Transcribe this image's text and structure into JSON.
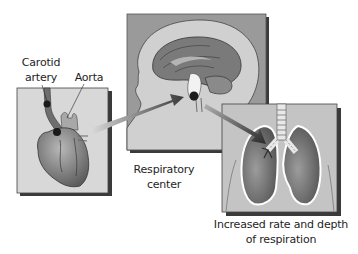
{
  "diagram": {
    "type": "physiology-flow",
    "panels": [
      {
        "id": "heart",
        "subject": "Heart with carotid artery and aorta"
      },
      {
        "id": "brain",
        "subject": "Head cross-section showing brainstem"
      },
      {
        "id": "lungs",
        "subject": "Lungs and trachea"
      }
    ],
    "labels": {
      "carotid_line1": "Carotid",
      "carotid_line2": "artery",
      "aorta": "Aorta",
      "respiratory_line1": "Respiratory",
      "respiratory_line2": "center",
      "result_line1": "Increased rate and depth",
      "result_line2": "of respiration"
    },
    "arrows": [
      {
        "from": "heart",
        "to": "brain"
      },
      {
        "from": "brain",
        "to": "lungs"
      }
    ],
    "colors": {
      "panel_light": "#d4d4d4",
      "panel_mid": "#9a9a9a",
      "shadow": "#3a3a3a",
      "organ_dark": "#6e6e6e",
      "marker": "#1a1a1a"
    }
  }
}
